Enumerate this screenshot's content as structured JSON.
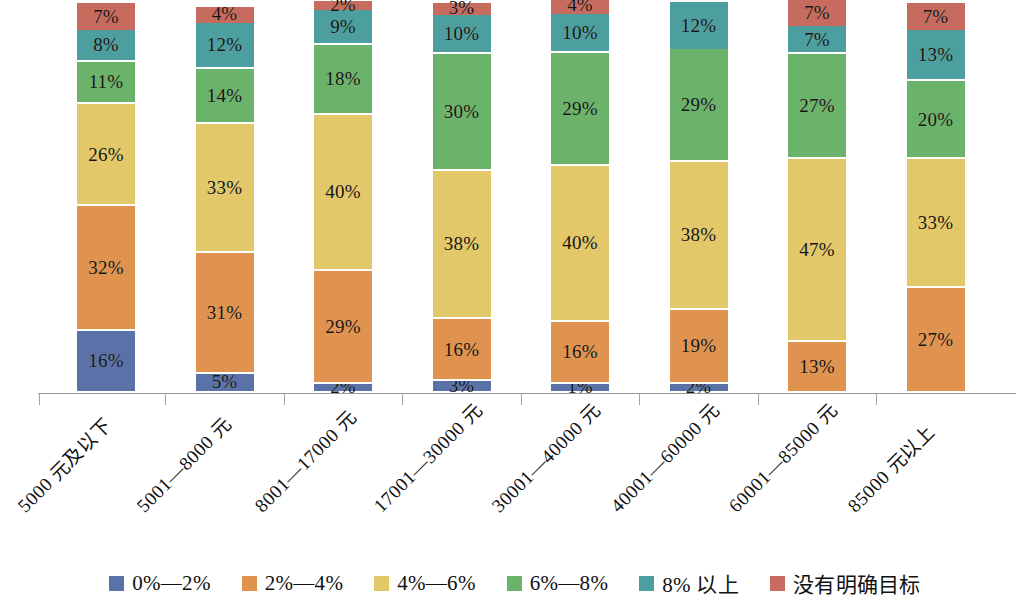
{
  "chart_data": {
    "type": "bar",
    "stacked": true,
    "title": "",
    "xlabel": "",
    "ylabel": "",
    "ylim": [
      0,
      100
    ],
    "grid": false,
    "legend_position": "bottom",
    "note_clipped_top": "Bars are clipped at the top edge of the image; the plot area is cut off above 100%.",
    "categories": [
      "5000 元及以下",
      "5001—8000 元",
      "8001—17000 元",
      "17001—30000 元",
      "30001—40000 元",
      "40001—60000 元",
      "60001—85000 元",
      "85000 元以上"
    ],
    "series": [
      {
        "name": "0%—2%",
        "color": "#5b72a8",
        "values": [
          16,
          5,
          2,
          3,
          1,
          2,
          null,
          null
        ],
        "labels": [
          "16%",
          "5%",
          "2%",
          "3%",
          "1%",
          "2%",
          "",
          ""
        ]
      },
      {
        "name": "2%—4%",
        "color": "#e0934f",
        "values": [
          32,
          31,
          29,
          16,
          16,
          19,
          13,
          27
        ],
        "labels": [
          "32%",
          "31%",
          "29%",
          "16%",
          "16%",
          "19%",
          "13%",
          "27%"
        ]
      },
      {
        "name": "4%—6%",
        "color": "#e2c868",
        "values": [
          26,
          33,
          40,
          38,
          40,
          38,
          47,
          33
        ],
        "labels": [
          "26%",
          "33%",
          "40%",
          "38%",
          "40%",
          "38%",
          "47%",
          "33%"
        ]
      },
      {
        "name": "6%—8%",
        "color": "#6bb26b",
        "values": [
          11,
          14,
          18,
          30,
          29,
          29,
          27,
          20
        ],
        "labels": [
          "11%",
          "14%",
          "18%",
          "30%",
          "29%",
          "29%",
          "27%",
          "20%"
        ]
      },
      {
        "name": "8% 以上",
        "color": "#4d9e9e",
        "values": [
          8,
          12,
          9,
          10,
          10,
          12,
          7,
          13
        ],
        "labels": [
          "8%",
          "12%",
          "9%",
          "10%",
          "10%",
          "12%",
          "7%",
          "13%"
        ]
      },
      {
        "name": "没有明确目标",
        "color": "#c66b5e",
        "values": [
          7,
          4,
          2,
          3,
          4,
          null,
          7,
          7
        ],
        "labels": [
          "7%",
          "4%",
          "2%",
          "3%",
          "4%",
          "",
          "7%",
          "7%"
        ]
      }
    ]
  },
  "legend": {
    "items": [
      {
        "label": "0%—2%",
        "color": "#5b72a8"
      },
      {
        "label": "2%—4%",
        "color": "#e0934f"
      },
      {
        "label": "4%—6%",
        "color": "#e2c868"
      },
      {
        "label": "6%—8%",
        "color": "#6bb26b"
      },
      {
        "label": "8% 以上",
        "color": "#4d9e9e"
      },
      {
        "label": "没有明确目标",
        "color": "#c66b5e"
      }
    ]
  }
}
